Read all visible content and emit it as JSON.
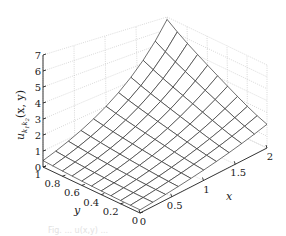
{
  "chart_data": {
    "type": "surface",
    "title": "",
    "xlabel": "x",
    "ylabel": "y",
    "zlabel": "u_{k1k2}(x,y)",
    "zlabel_main": "u",
    "zlabel_sub": "k",
    "zlabel_sub1": "1",
    "zlabel_sub2": "2",
    "zlabel_args": "(x, y)",
    "xlim": [
      0,
      2
    ],
    "ylim": [
      0,
      1
    ],
    "zlim": [
      0,
      7
    ],
    "xticks": [
      0,
      0.5,
      1,
      1.5,
      2
    ],
    "xtick_labels": [
      "0",
      "0.5",
      "1",
      "1.5",
      "2"
    ],
    "yticks": [
      0,
      0.2,
      0.4,
      0.6,
      0.8,
      1
    ],
    "ytick_labels": [
      "0",
      "0.2",
      "0.4",
      "0.6",
      "0.8",
      "1"
    ],
    "zticks": [
      0,
      1,
      2,
      3,
      4,
      5,
      6,
      7
    ],
    "ztick_labels": [
      "0",
      "1",
      "2",
      "3",
      "4",
      "5",
      "6",
      "7"
    ],
    "grid": true,
    "mesh": {
      "nx": 11,
      "ny": 11,
      "x": [
        0,
        0.2,
        0.4,
        0.6,
        0.8,
        1.0,
        1.2,
        1.4,
        1.6,
        1.8,
        2.0
      ],
      "y": [
        0,
        0.1,
        0.2,
        0.3,
        0.4,
        0.5,
        0.6,
        0.7,
        0.8,
        0.9,
        1.0
      ],
      "z_description": "Surface rising from ~0.3 at x=0 to ~6.8 at x=2, higher toward y=1",
      "z_corner_values": {
        "x0_y0": 0.2,
        "x0_y1": 0.4,
        "x2_y0": 2.0,
        "x2_y1": 6.8
      }
    },
    "line_color": "#333333",
    "face_color": "#ffffff"
  },
  "caption_faint": "Fig. ... u(x,y) ..."
}
